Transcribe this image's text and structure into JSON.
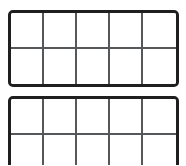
{
  "page": {
    "background_color": "#ffffff",
    "width": 186,
    "height": 165
  },
  "style": {
    "outer_border_color": "#201f1f",
    "inner_grid_color": "#55585a",
    "cell_fill_color": "#ffffff",
    "outer_border_width_px": 3,
    "inner_grid_width_px": 2,
    "corner_radius_px": 5
  },
  "frames": [
    {
      "name": "ten-frame-top",
      "columns": 5,
      "rows": 2,
      "total_cells": 10,
      "filled_cells": 0,
      "clipped": false,
      "cells": [
        {
          "row": 1,
          "col": 1,
          "filled": false
        },
        {
          "row": 1,
          "col": 2,
          "filled": false
        },
        {
          "row": 1,
          "col": 3,
          "filled": false
        },
        {
          "row": 1,
          "col": 4,
          "filled": false
        },
        {
          "row": 1,
          "col": 5,
          "filled": false
        },
        {
          "row": 2,
          "col": 1,
          "filled": false
        },
        {
          "row": 2,
          "col": 2,
          "filled": false
        },
        {
          "row": 2,
          "col": 3,
          "filled": false
        },
        {
          "row": 2,
          "col": 4,
          "filled": false
        },
        {
          "row": 2,
          "col": 5,
          "filled": false
        }
      ]
    },
    {
      "name": "ten-frame-bottom",
      "columns": 5,
      "rows": 2,
      "total_cells": 10,
      "filled_cells": 0,
      "clipped": true,
      "cells": [
        {
          "row": 1,
          "col": 1,
          "filled": false
        },
        {
          "row": 1,
          "col": 2,
          "filled": false
        },
        {
          "row": 1,
          "col": 3,
          "filled": false
        },
        {
          "row": 1,
          "col": 4,
          "filled": false
        },
        {
          "row": 1,
          "col": 5,
          "filled": false
        },
        {
          "row": 2,
          "col": 1,
          "filled": false
        },
        {
          "row": 2,
          "col": 2,
          "filled": false
        },
        {
          "row": 2,
          "col": 3,
          "filled": false
        },
        {
          "row": 2,
          "col": 4,
          "filled": false
        },
        {
          "row": 2,
          "col": 5,
          "filled": false
        }
      ]
    }
  ]
}
